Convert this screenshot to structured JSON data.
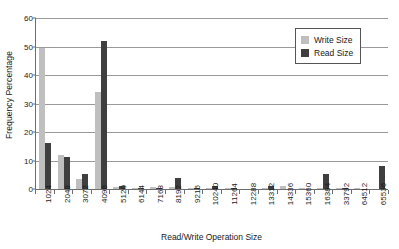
{
  "chart_data": {
    "type": "bar",
    "title": "",
    "xlabel": "Read/Write Operation Size",
    "ylabel": "Frequency Percentage",
    "ylim": [
      0,
      60
    ],
    "ytick_step": 10,
    "yticks": [
      0,
      10,
      20,
      30,
      40,
      50,
      60
    ],
    "grid": "horizontal",
    "legend_position": "top-right-inside",
    "categories": [
      "1024",
      "2048",
      "3072",
      "4096",
      "5120",
      "6144",
      "7168",
      "8192",
      "9216",
      "10240",
      "11264",
      "12288",
      "13312",
      "14336",
      "15360",
      "16384",
      "33792",
      "64512",
      "65536"
    ],
    "series": [
      {
        "name": "Write Size",
        "color": "#bfbfbf",
        "values": [
          49.5,
          12.0,
          3.4,
          34.2,
          0.8,
          0.5,
          0.8,
          0.8,
          0.3,
          0.2,
          0.2,
          0.0,
          0.5,
          1.1,
          0.3,
          0.3,
          0.2,
          0.3,
          0.0
        ]
      },
      {
        "name": "Read Size",
        "color": "#3f3f3f",
        "values": [
          16.0,
          11.3,
          5.2,
          52.0,
          1.2,
          0.4,
          0.4,
          4.0,
          0.5,
          0.9,
          0.5,
          0.0,
          0.9,
          0.0,
          0.0,
          5.3,
          0.3,
          0.0,
          8.2
        ]
      }
    ]
  },
  "legend": {
    "items": [
      {
        "label": "Write Size"
      },
      {
        "label": "Read Size"
      }
    ]
  }
}
